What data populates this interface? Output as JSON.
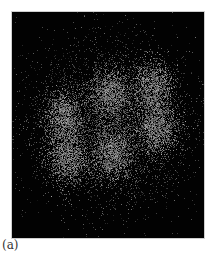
{
  "figure": {
    "panel_label": "(a)",
    "image": {
      "description": "Noisy speckle intensity image: six diffuse bright lobes arranged in a ring on a black background",
      "background_color": "#020202",
      "speckle_color": "#9a9a9a",
      "lobes": [
        {
          "name": "top-middle",
          "cx": 98,
          "cy": 81
        },
        {
          "name": "top-right",
          "cx": 141,
          "cy": 75
        },
        {
          "name": "left",
          "cx": 51,
          "cy": 105
        },
        {
          "name": "right",
          "cx": 145,
          "cy": 115
        },
        {
          "name": "bottom-left",
          "cx": 55,
          "cy": 145
        },
        {
          "name": "bottom-middle",
          "cx": 100,
          "cy": 141
        }
      ]
    }
  }
}
